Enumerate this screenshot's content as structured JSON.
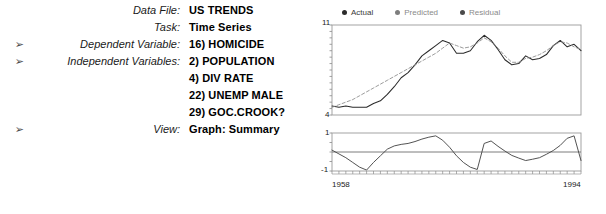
{
  "info": {
    "rows": [
      {
        "arrow": "",
        "label": "Data File:",
        "value": "US TRENDS"
      },
      {
        "arrow": "",
        "label": "Task:",
        "value": "Time Series"
      },
      {
        "arrow": "➢",
        "label": "Dependent Variable:",
        "value": "16) HOMICIDE"
      },
      {
        "arrow": "➢",
        "label": "Independent Variables:",
        "value": "2) POPULATION"
      },
      {
        "arrow": "",
        "label": "",
        "value": "4) DIV RATE"
      },
      {
        "arrow": "",
        "label": "",
        "value": "22) UNEMP MALE"
      },
      {
        "arrow": "",
        "label": "",
        "value": "29) GOC.CROOK?"
      },
      {
        "arrow": "➢",
        "label": "View:",
        "value": "Graph: Summary"
      }
    ]
  },
  "chart_legend": {
    "items": [
      {
        "label": "Actual",
        "color": "#2b2b2b",
        "muted": false
      },
      {
        "label": "Predicted",
        "color": "#7d7d7d",
        "muted": true
      },
      {
        "label": "Residual",
        "color": "#4a4a4a",
        "muted": true
      }
    ]
  },
  "axis_labels": {
    "main_y_top": "11",
    "main_y_bottom": "4",
    "resid_y_top": "1",
    "resid_y_bottom": "-1",
    "x_start": "1958",
    "x_end": "1994"
  },
  "chart_data": [
    {
      "type": "line",
      "title": "Graph: Summary",
      "xlabel": "",
      "ylabel": "",
      "ylim": [
        4,
        11
      ],
      "xlim": [
        1958,
        1994
      ],
      "grid": false,
      "legend_position": "top-left",
      "x": [
        1958,
        1959,
        1960,
        1961,
        1962,
        1963,
        1964,
        1965,
        1966,
        1967,
        1968,
        1969,
        1970,
        1971,
        1972,
        1973,
        1974,
        1975,
        1976,
        1977,
        1978,
        1979,
        1980,
        1981,
        1982,
        1983,
        1984,
        1985,
        1986,
        1987,
        1988,
        1989,
        1990,
        1991,
        1992,
        1993,
        1994
      ],
      "series": [
        {
          "name": "Actual",
          "style": "solid",
          "color": "#2b2b2b",
          "values": [
            4.7,
            4.6,
            4.7,
            4.6,
            4.6,
            4.6,
            4.9,
            5.1,
            5.6,
            6.2,
            6.9,
            7.3,
            7.9,
            8.6,
            9.0,
            9.4,
            9.8,
            9.6,
            8.8,
            8.8,
            9.0,
            9.7,
            10.2,
            9.8,
            9.1,
            8.3,
            7.9,
            8.0,
            8.6,
            8.3,
            8.4,
            8.7,
            9.4,
            9.8,
            9.3,
            9.5,
            9.0
          ],
          "note": "solid dark line; rises from ~4.7 (1958) to peak ~10.2 (1980), dips to ~7.9 (1984), rises again to ~9.8 (1991), ends ~9.0"
        },
        {
          "name": "Predicted",
          "style": "dashed",
          "color": "#8a8a8a",
          "values": [
            4.6,
            4.8,
            5.0,
            5.2,
            5.5,
            5.8,
            6.1,
            6.4,
            6.7,
            7.0,
            7.3,
            7.6,
            7.9,
            8.2,
            8.5,
            8.8,
            9.2,
            9.6,
            9.4,
            9.2,
            9.3,
            9.6,
            10.0,
            9.7,
            9.2,
            8.6,
            8.1,
            8.1,
            8.4,
            8.5,
            8.7,
            9.0,
            9.4,
            9.7,
            9.6,
            9.3,
            9.1
          ],
          "note": "dashed grey line tracking the actual series; nearly straight rising segment 1958-1974 then follows actual closely"
        }
      ]
    },
    {
      "type": "line",
      "title": "Residual",
      "xlabel": "",
      "ylabel": "",
      "ylim": [
        -1,
        1
      ],
      "xlim": [
        1958,
        1994
      ],
      "grid": false,
      "zero_line": true,
      "legend_position": "none",
      "x": [
        1958,
        1959,
        1960,
        1961,
        1962,
        1963,
        1964,
        1965,
        1966,
        1967,
        1968,
        1969,
        1970,
        1971,
        1972,
        1973,
        1974,
        1975,
        1976,
        1977,
        1978,
        1979,
        1980,
        1981,
        1982,
        1983,
        1984,
        1985,
        1986,
        1987,
        1988,
        1989,
        1990,
        1991,
        1992,
        1993,
        1994
      ],
      "series": [
        {
          "name": "Residual",
          "style": "solid",
          "color": "#4a4a4a",
          "values": [
            0.1,
            -0.1,
            -0.3,
            -0.55,
            -0.8,
            -0.95,
            -0.55,
            -0.2,
            0.15,
            0.32,
            0.4,
            0.45,
            0.55,
            0.68,
            0.78,
            0.85,
            0.62,
            0.25,
            -0.2,
            -0.55,
            -0.8,
            -0.92,
            0.45,
            0.58,
            0.3,
            0.05,
            -0.18,
            -0.32,
            -0.45,
            -0.38,
            -0.3,
            -0.12,
            0.08,
            0.35,
            0.72,
            0.85,
            -0.45
          ],
          "note": "oscillating residual about the zero line, min ~-0.95 and max ~0.85"
        }
      ]
    }
  ]
}
